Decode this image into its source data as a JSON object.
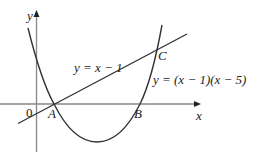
{
  "diagram": {
    "axes": {
      "x_label": "x",
      "y_label": "y",
      "origin_label": "0"
    },
    "curves": {
      "line_label": "y = x − 1",
      "parabola_label": "y = (x − 1)(x − 5)"
    },
    "points": {
      "A": "A",
      "B": "B",
      "C": "C"
    },
    "colors": {
      "stroke": "#333333",
      "axis": "#777777",
      "background": "#ffffff"
    }
  }
}
